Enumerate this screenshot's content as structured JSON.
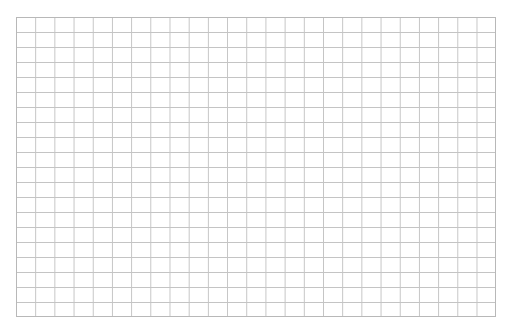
{
  "header": {
    "text": "▀▀▀ ▀▀▀▀▀ ▀▀▀▀▀▀▀▀▀▀▀▀▀▀▀▀▀▀"
  },
  "grid": {
    "columns": 25,
    "rows": 20,
    "line_color": "#c4c4c4",
    "border_color": "#b8b8b8",
    "background": "#ffffff"
  }
}
